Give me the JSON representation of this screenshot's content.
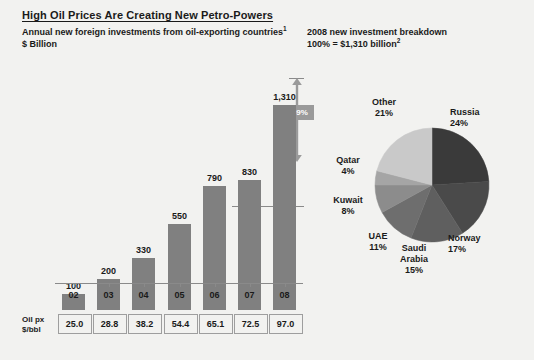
{
  "header": {
    "title": "High Oil Prices Are Creating New Petro-Powers",
    "left_subtitle_line1": "Annual new foreign investments from oil-exporting countries",
    "left_subtitle_line1_note": "1",
    "left_subtitle_line2": "$ Billion",
    "right_subtitle_line1": "2008 new investment breakdown",
    "right_subtitle_line2": "100% = $1,310 billion",
    "right_subtitle_line2_note": "2"
  },
  "growth_callout": {
    "label": "+59%",
    "from_value": 830,
    "to_value": 1310
  },
  "oil_price_table": {
    "row_label_line1": "Oil px",
    "row_label_line2": "$/bbl",
    "values": [
      "25.0",
      "28.8",
      "38.2",
      "54.4",
      "65.1",
      "72.5",
      "97.0"
    ]
  },
  "colors": {
    "background": "#f2f2f0",
    "bar_fill": "#808080",
    "axis": "#8a8a8a",
    "badge": "#9a9a9a",
    "text": "#1a1a1a",
    "pie_russia": "#3a3a3a",
    "pie_norway": "#4a4a4a",
    "pie_saudi": "#5f5f5f",
    "pie_uae": "#6e6e6e",
    "pie_kuwait": "#8c8c8c",
    "pie_qatar": "#a5a5a5",
    "pie_other": "#c9c9c9"
  },
  "chart_data": [
    {
      "type": "bar",
      "title": "Annual new foreign investments from oil-exporting countries",
      "subtitle": "$ Billion",
      "xlabel": "",
      "ylabel": "$ Billion",
      "categories": [
        "02",
        "03",
        "04",
        "05",
        "06",
        "07",
        "08"
      ],
      "values": [
        100,
        200,
        330,
        550,
        790,
        830,
        1310
      ],
      "value_labels": [
        "100",
        "200",
        "330",
        "550",
        "790",
        "830",
        "1,310"
      ],
      "ylim": [
        0,
        1310
      ],
      "grid": false,
      "legend": "none",
      "annotations": [
        {
          "text": "+59%",
          "from": 830,
          "to": 1310,
          "note": "growth from 07 to 08"
        }
      ],
      "secondary_table": {
        "label": "Oil px $/bbl",
        "values": [
          25.0,
          28.8,
          38.2,
          54.4,
          65.1,
          72.5,
          97.0
        ]
      }
    },
    {
      "type": "pie",
      "title": "2008 new investment breakdown",
      "subtitle": "100% = $1,310 billion",
      "legend": "labels-around-slices",
      "labels": [
        "Russia",
        "Norway",
        "Saudi Arabia",
        "UAE",
        "Kuwait",
        "Qatar",
        "Other"
      ],
      "values": [
        24,
        17,
        15,
        11,
        8,
        4,
        21
      ],
      "value_labels": [
        "24%",
        "17%",
        "15%",
        "11%",
        "8%",
        "4%",
        "21%"
      ],
      "units": "percent",
      "total_label": "100% = $1,310 billion"
    }
  ],
  "bar_chart": {
    "bars": [
      {
        "category": "02",
        "value": 100,
        "label": "100"
      },
      {
        "category": "03",
        "value": 200,
        "label": "200"
      },
      {
        "category": "04",
        "value": 330,
        "label": "330"
      },
      {
        "category": "05",
        "value": 550,
        "label": "550"
      },
      {
        "category": "06",
        "value": 790,
        "label": "790"
      },
      {
        "category": "07",
        "value": 830,
        "label": "830"
      },
      {
        "category": "08",
        "value": 1310,
        "label": "1,310"
      }
    ]
  },
  "pie_chart": {
    "slices": [
      {
        "name": "Russia",
        "value": 24,
        "label": "Russia",
        "pct": "24%"
      },
      {
        "name": "Norway",
        "value": 17,
        "label": "Norway",
        "pct": "17%"
      },
      {
        "name": "Saudi Arabia",
        "value": 15,
        "label": "Saudi",
        "label2": "Arabia",
        "pct": "15%"
      },
      {
        "name": "UAE",
        "value": 11,
        "label": "UAE",
        "pct": "11%"
      },
      {
        "name": "Kuwait",
        "value": 8,
        "label": "Kuwait",
        "pct": "8%"
      },
      {
        "name": "Qatar",
        "value": 4,
        "label": "Qatar",
        "pct": "4%"
      },
      {
        "name": "Other",
        "value": 21,
        "label": "Other",
        "pct": "21%"
      }
    ]
  }
}
